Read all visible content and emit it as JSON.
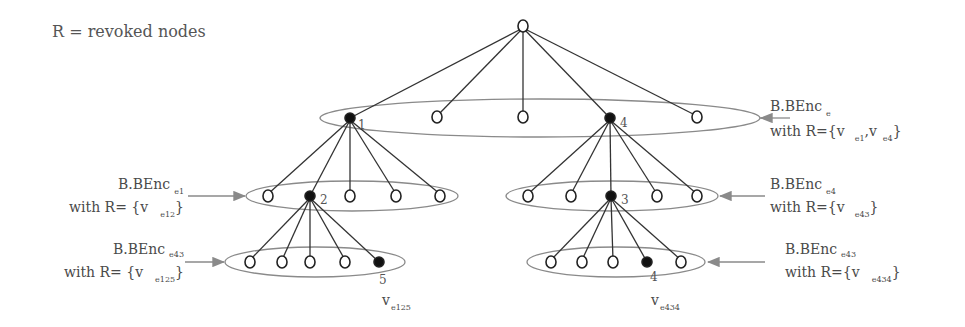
{
  "legend": "R = revoked nodes",
  "tree": {
    "root": {
      "id": "root",
      "revoked": false
    },
    "level1": [
      {
        "label": "1",
        "revoked": true
      },
      {
        "label": "",
        "revoked": false
      },
      {
        "label": "",
        "revoked": false
      },
      {
        "label": "4",
        "revoked": true
      },
      {
        "label": "",
        "revoked": false
      }
    ],
    "level2_left": [
      {
        "label": "",
        "revoked": false
      },
      {
        "label": "2",
        "revoked": true
      },
      {
        "label": "",
        "revoked": false
      },
      {
        "label": "",
        "revoked": false
      },
      {
        "label": "",
        "revoked": false
      }
    ],
    "level2_right": [
      {
        "label": "",
        "revoked": false
      },
      {
        "label": "",
        "revoked": false
      },
      {
        "label": "3",
        "revoked": true
      },
      {
        "label": "",
        "revoked": false
      },
      {
        "label": "",
        "revoked": false
      }
    ],
    "level3_left": [
      {
        "label": "",
        "revoked": false
      },
      {
        "label": "",
        "revoked": false
      },
      {
        "label": "",
        "revoked": false
      },
      {
        "label": "",
        "revoked": false
      },
      {
        "label": "5",
        "revoked": true
      }
    ],
    "level3_right": [
      {
        "label": "",
        "revoked": false
      },
      {
        "label": "",
        "revoked": false
      },
      {
        "label": "",
        "revoked": false
      },
      {
        "label": "4",
        "revoked": true
      },
      {
        "label": "",
        "revoked": false
      }
    ]
  },
  "node_labels": {
    "n1": "1",
    "n4": "4",
    "n2": "2",
    "n3": "3",
    "n5": "5",
    "n4b": "4",
    "leaf_left_v": "v",
    "leaf_left_sub": "e125",
    "leaf_right_v": "v",
    "leaf_right_sub": "e434"
  },
  "annotations": {
    "top_right": {
      "line1": "B.BEnc",
      "line1_sub": "e",
      "line2_prefix": "with R={v",
      "line2_sub1": "e1",
      "line2_mid": ",v",
      "line2_sub2": "e4",
      "line2_suffix": "}"
    },
    "mid_left": {
      "line1": "B.BEnc",
      "line1_sub": "e1",
      "line2_prefix": "with R= {v",
      "line2_sub": "e12",
      "line2_suffix": "}"
    },
    "mid_right": {
      "line1": "B.BEnc",
      "line1_sub": "e4",
      "line2_prefix": "with R={v",
      "line2_sub": "e43",
      "line2_suffix": "}"
    },
    "bottom_left": {
      "line1": "B.BEnc",
      "line1_sub": "e43",
      "line2_prefix": "with R= {v",
      "line2_sub": "e125",
      "line2_suffix": "}"
    },
    "bottom_right": {
      "line1": "B.BEnc",
      "line1_sub": "e43",
      "line2_prefix": "with R={v",
      "line2_sub": "e434",
      "line2_suffix": "}"
    }
  },
  "colors": {
    "edge": "#333333",
    "ellipse": "#8a8a8a",
    "arrow": "#8a8a8a",
    "revoked_node": "#111111",
    "node_outline": "#222222"
  }
}
